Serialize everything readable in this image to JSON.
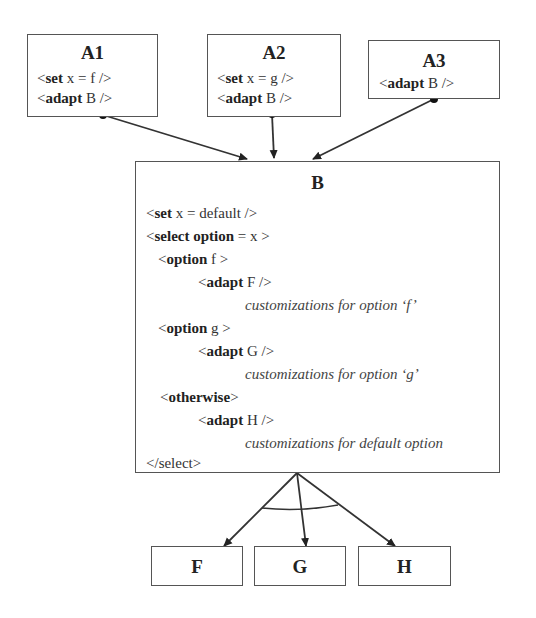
{
  "boxes": {
    "a1": {
      "title": "A1",
      "lines": [
        {
          "open": "<",
          "kw": "set",
          "rest": " x = f />"
        },
        {
          "open": "<",
          "kw": "adapt",
          "rest": " B />"
        }
      ]
    },
    "a2": {
      "title": "A2",
      "lines": [
        {
          "open": "<",
          "kw": "set",
          "rest": " x = g />"
        },
        {
          "open": "<",
          "kw": "adapt",
          "rest": " B />"
        }
      ]
    },
    "a3": {
      "title": "A3",
      "lines": [
        {
          "open": "<",
          "kw": "adapt",
          "rest": " B />"
        }
      ]
    },
    "b": {
      "title": "B",
      "lines": [
        {
          "open": "<",
          "kw": "set",
          "rest": " x = default />"
        },
        {
          "open": "<",
          "kw": "select option",
          "rest": " = x  >"
        },
        {
          "open": "<",
          "kw": "option",
          "rest": " f >"
        },
        {
          "open": "<",
          "kw": "adapt",
          "rest": " F />"
        },
        {
          "comment": "customizations for option ‘f’"
        },
        {
          "open": "<",
          "kw": "option",
          "rest": " g >"
        },
        {
          "open": "<",
          "kw": "adapt",
          "rest": " G />"
        },
        {
          "comment": "customizations for option ‘g’"
        },
        {
          "open": "<",
          "kw": "otherwise",
          "rest": ">"
        },
        {
          "open": "<",
          "kw": "adapt",
          "rest": " H />"
        },
        {
          "comment": "customizations for default option"
        },
        {
          "plain": "</select>"
        }
      ]
    },
    "f": {
      "title": "F"
    },
    "g": {
      "title": "G"
    },
    "h": {
      "title": "H"
    }
  },
  "colors": {
    "stroke": "#333333",
    "box_border": "#555555",
    "background": "#ffffff"
  }
}
